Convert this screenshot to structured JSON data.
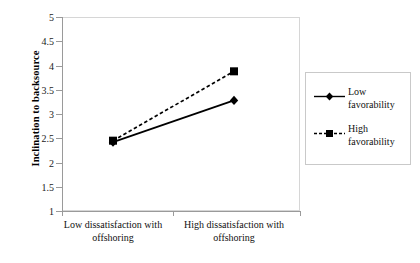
{
  "chart_data": {
    "type": "line",
    "title": "",
    "xlabel": "",
    "ylabel": "Inclination to backsource",
    "categories": [
      "Low dissatisfaction with offshoring",
      "High dissatisfaction with offshoring"
    ],
    "series": [
      {
        "name": "Low favorability",
        "values": [
          2.42,
          3.28
        ],
        "linestyle": "solid",
        "marker": "diamond",
        "color": "#000000"
      },
      {
        "name": "High favorability",
        "values": [
          2.45,
          3.88
        ],
        "linestyle": "dashed",
        "marker": "square",
        "color": "#000000"
      }
    ],
    "ylim": [
      1,
      5
    ],
    "ytick_step": 0.5,
    "ytick_labels": [
      "1",
      "1.5",
      "2",
      "2.5",
      "3",
      "3.5",
      "4",
      "4.5",
      "5"
    ],
    "ytick_values": [
      1,
      1.5,
      2,
      2.5,
      3,
      3.5,
      4,
      4.5,
      5
    ],
    "grid": false,
    "legend_position": "right"
  },
  "legend": {
    "entries": [
      {
        "label": "Low favorability"
      },
      {
        "label": "High favorability"
      }
    ]
  },
  "colors": {
    "axis": "#9a9a9a",
    "frame": "#d6d6d6",
    "series": "#000000",
    "text": "#111111"
  }
}
